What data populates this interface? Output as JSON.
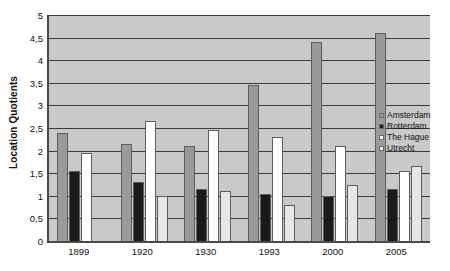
{
  "chart_data": {
    "type": "bar",
    "title": "",
    "xlabel": "",
    "ylabel": "Location Quotients",
    "ylim": [
      0,
      5
    ],
    "ytick_step": 0.5,
    "grid": true,
    "decimal_separator": ",",
    "legend_position": "right",
    "categories": [
      "1899",
      "1920",
      "1930",
      "1993",
      "2000",
      "2005"
    ],
    "ytick_labels": [
      "5",
      "4,5",
      "4",
      "3,5",
      "3",
      "2,5",
      "2",
      "1,5",
      "1",
      "0,5",
      "0"
    ],
    "ytick_values": [
      5,
      4.5,
      4,
      3.5,
      3,
      2.5,
      2,
      1.5,
      1,
      0.5,
      0
    ],
    "series": [
      {
        "name": "Amsterdam",
        "color": "#9a9a9a",
        "values": [
          2.4,
          2.15,
          2.1,
          3.45,
          4.4,
          4.6
        ]
      },
      {
        "name": "Rotterdam",
        "color": "#1a1a1a",
        "values": [
          1.55,
          1.3,
          1.15,
          1.05,
          1.0,
          1.15
        ]
      },
      {
        "name": "The Hague",
        "color": "#ffffff",
        "values": [
          1.95,
          2.65,
          2.45,
          2.3,
          2.1,
          1.55
        ]
      },
      {
        "name": "Utrecht",
        "color": "#e6e6e6",
        "values": [
          0.0,
          1.0,
          1.1,
          0.8,
          1.25,
          1.65
        ]
      }
    ]
  },
  "legend": {
    "items": [
      {
        "label": "Amsterdam"
      },
      {
        "label": "Rotterdam"
      },
      {
        "label": "The Hague"
      },
      {
        "label": "Utrecht"
      }
    ]
  },
  "axes": {
    "y_title": "Location Quotients"
  }
}
